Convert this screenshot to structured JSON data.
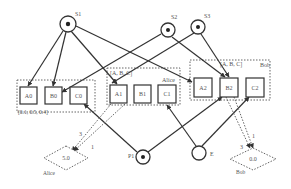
{
  "diagram": {
    "colors": {
      "stroke": "#333333",
      "dotted": "#666666",
      "text": "#555555",
      "background": "#ffffff"
    },
    "sources": [
      {
        "id": "S1",
        "label": "S1"
      },
      {
        "id": "S2",
        "label": "S2"
      },
      {
        "id": "S3",
        "label": "S3"
      }
    ],
    "groups": [
      {
        "id": "g0",
        "label": "[0.1, 0.5, 0.4]",
        "nodes": [
          "A0",
          "B0",
          "C0"
        ]
      },
      {
        "id": "g1",
        "label": "[A, B, C]",
        "owner": "Alice",
        "nodes": [
          "A1",
          "B1",
          "C1"
        ]
      },
      {
        "id": "g2",
        "label": "[A, B, C]",
        "owner": "Bob",
        "nodes": [
          "A2",
          "B2",
          "C2"
        ]
      }
    ],
    "nodes": [
      "A0",
      "B0",
      "C0",
      "A1",
      "B1",
      "C1",
      "A2",
      "B2",
      "C2"
    ],
    "bottom_nodes": [
      {
        "id": "P1",
        "label": "P1"
      },
      {
        "id": "E",
        "label": "E"
      }
    ],
    "outcomes": [
      {
        "id": "alice",
        "value": "5.0",
        "label": "Alice",
        "edge_labels": [
          "3",
          "1"
        ]
      },
      {
        "id": "bob",
        "value": "0.0",
        "label": "Bob",
        "edge_labels": [
          "3",
          "1"
        ]
      }
    ]
  }
}
